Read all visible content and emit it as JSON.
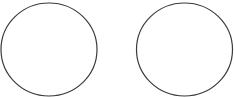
{
  "canvas": {
    "width": 234,
    "height": 97,
    "background": "#ffffff"
  },
  "shapes": [
    {
      "type": "circle-outline",
      "cx": 49,
      "cy": 49.5,
      "rx": 48,
      "ry": 46.5,
      "stroke": "#3a3a3a",
      "fill": "none"
    },
    {
      "type": "circle-outline",
      "cx": 184.5,
      "cy": 49.5,
      "rx": 48,
      "ry": 46.5,
      "stroke": "#3a3a3a",
      "fill": "none"
    }
  ]
}
